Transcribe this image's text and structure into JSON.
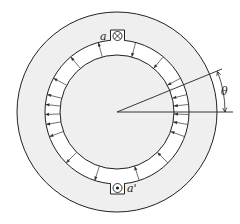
{
  "diagram": {
    "labels": {
      "coil_top": "a",
      "coil_bottom": "a'",
      "angle": "θ"
    },
    "symbols": {
      "coil_top": "current-into-page-cross",
      "coil_bottom": "current-out-of-page-dot"
    },
    "geometry": {
      "center": [
        117,
        112
      ],
      "stator_outer_radius": 100,
      "stator_inner_radius": 72,
      "rotor_radius": 57
    },
    "air_gap_arrows": {
      "left_half_direction": "outward (rotor to stator)",
      "right_half_direction": "inward (stator to rotor)",
      "left_angles_deg": [
        105,
        130,
        152,
        166,
        174,
        182,
        190,
        200,
        225,
        252
      ],
      "right_angles_deg": [
        75,
        50,
        28,
        14,
        6,
        -2,
        -10,
        -20,
        -45,
        -72
      ]
    },
    "colors": {
      "line": "#222222",
      "stator_fill": "#eeeeee",
      "rotor_fill": "#eeeeee",
      "gap_fill": "#ffffff"
    }
  }
}
